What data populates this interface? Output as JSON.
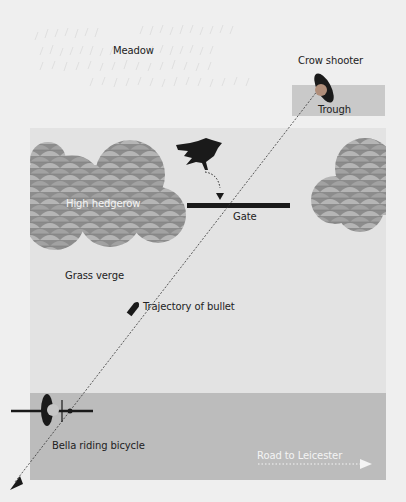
{
  "diagram": {
    "type": "scene-map",
    "labels": {
      "meadow": "Meadow",
      "crow_shooter": "Crow shooter",
      "trough": "Trough",
      "high_hedgerow": "High hedgerow",
      "gate": "Gate",
      "grass_verge": "Grass verge",
      "trajectory": "Trajectory of bullet",
      "cyclist": "Bella riding bicycle",
      "road": "Road to Leicester"
    },
    "icons": {
      "shooter": "person-topdown-icon",
      "crow": "crow-icon",
      "bullet": "bullet-icon",
      "cyclist": "bicycle-rider-icon",
      "road_arrow": "arrow-right-icon",
      "bullet_arrow": "arrow-down-left-icon"
    },
    "colors": {
      "background": "#efefef",
      "verge": "#e3e3e3",
      "road": "#bcbcbc",
      "trough": "#c9c9c9",
      "hedge_dark": "#8a8a8a",
      "hedge_light": "#b8b8b8",
      "ink": "#1a1a1a",
      "road_text": "#f4f4f4"
    }
  }
}
